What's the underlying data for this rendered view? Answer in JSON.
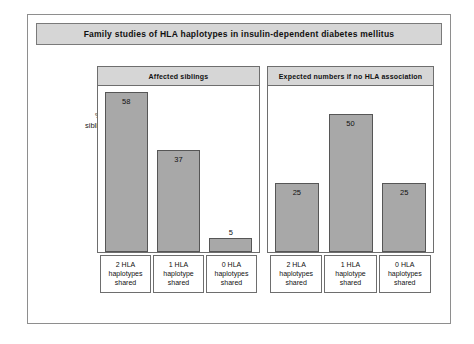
{
  "figure": {
    "title": "Family studies of HLA haplotypes in insulin-dependent diabetes mellitus",
    "y_axis_label_line1": "% of",
    "y_axis_label_line2": "siblings"
  },
  "colors": {
    "bar_fill": "#a8a8a8",
    "bar_border": "#565656",
    "banner_fill": "#d6d6d6",
    "frame_border": "#8e8e8e"
  },
  "chart_data": {
    "type": "bar",
    "title": "Family studies of HLA haplotypes in insulin-dependent diabetes mellitus",
    "xlabel": "",
    "ylabel": "% of siblings",
    "ylim": [
      0,
      60
    ],
    "grid": false,
    "legend": "none",
    "categories": [
      "2 HLA haplotypes shared",
      "1 HLA haplotype shared",
      "0 HLA haplotypes shared"
    ],
    "panels": [
      {
        "name": "Affected siblings",
        "values": [
          58,
          37,
          5
        ],
        "value_label_position": [
          "inside",
          "inside",
          "above"
        ]
      },
      {
        "name": "Expected numbers if no HLA association",
        "values": [
          25,
          50,
          25
        ],
        "value_label_position": [
          "inside",
          "inside",
          "inside"
        ]
      }
    ],
    "series": [
      {
        "name": "Affected siblings",
        "values": [
          58,
          37,
          5
        ]
      },
      {
        "name": "Expected numbers if no HLA association",
        "values": [
          25,
          50,
          25
        ]
      }
    ]
  },
  "panels": [
    {
      "header": "Affected siblings",
      "bars": [
        {
          "value": "58",
          "pct": 58,
          "label_pos": "inside",
          "label": {
            "l1": "2 HLA",
            "l2": "haplotypes",
            "l3": "shared"
          }
        },
        {
          "value": "37",
          "pct": 37,
          "label_pos": "inside",
          "label": {
            "l1": "1 HLA",
            "l2": "haplotype",
            "l3": "shared"
          }
        },
        {
          "value": "5",
          "pct": 5,
          "label_pos": "above",
          "label": {
            "l1": "0 HLA",
            "l2": "haplotypes",
            "l3": "shared"
          }
        }
      ]
    },
    {
      "header": "Expected numbers if no HLA association",
      "bars": [
        {
          "value": "25",
          "pct": 25,
          "label_pos": "inside",
          "label": {
            "l1": "2 HLA",
            "l2": "haplotypes",
            "l3": "shared"
          }
        },
        {
          "value": "50",
          "pct": 50,
          "label_pos": "inside",
          "label": {
            "l1": "1 HLA",
            "l2": "haplotype",
            "l3": "shared"
          }
        },
        {
          "value": "25",
          "pct": 25,
          "label_pos": "inside",
          "label": {
            "l1": "0 HLA",
            "l2": "haplotypes",
            "l3": "shared"
          }
        }
      ]
    }
  ]
}
